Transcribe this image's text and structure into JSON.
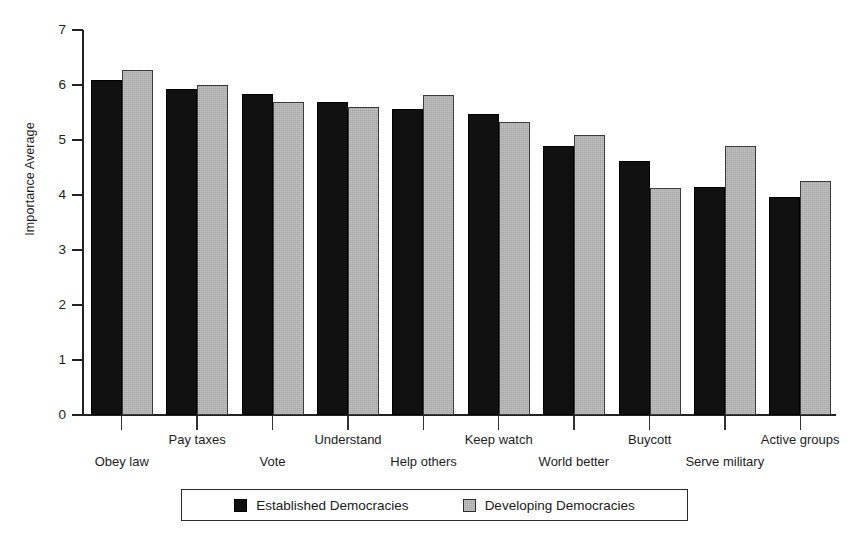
{
  "chart_data": {
    "type": "bar",
    "title": "",
    "subtitle": "",
    "xlabel": "",
    "ylabel": "Importance Average",
    "ylim": [
      0,
      7
    ],
    "yticks": [
      0,
      1,
      2,
      3,
      4,
      5,
      6,
      7
    ],
    "ytick_labels": [
      "0",
      "1",
      "2",
      "3",
      "4",
      "5",
      "6",
      "7"
    ],
    "grid": false,
    "legend_position": "bottom-center",
    "categories": [
      "Obey law",
      "Pay taxes",
      "Vote",
      "Understand",
      "Help others",
      "Keep watch",
      "World better",
      "Buycott",
      "Serve military",
      "Active groups"
    ],
    "series": [
      {
        "name": "Established Democracies",
        "color": "#111111",
        "values": [
          6.1,
          5.93,
          5.84,
          5.7,
          5.56,
          5.47,
          4.9,
          4.62,
          4.14,
          3.96
        ]
      },
      {
        "name": "Developing Democracies",
        "color": "#a8a8a8",
        "values": [
          6.28,
          6.0,
          5.7,
          5.6,
          5.82,
          5.33,
          5.1,
          4.13,
          4.89,
          4.26
        ]
      }
    ]
  },
  "legend": {
    "entries": [
      {
        "label": "Established Democracies",
        "swatch": "black-square-icon"
      },
      {
        "label": "Developing Democracies",
        "swatch": "gray-square-icon"
      }
    ]
  }
}
